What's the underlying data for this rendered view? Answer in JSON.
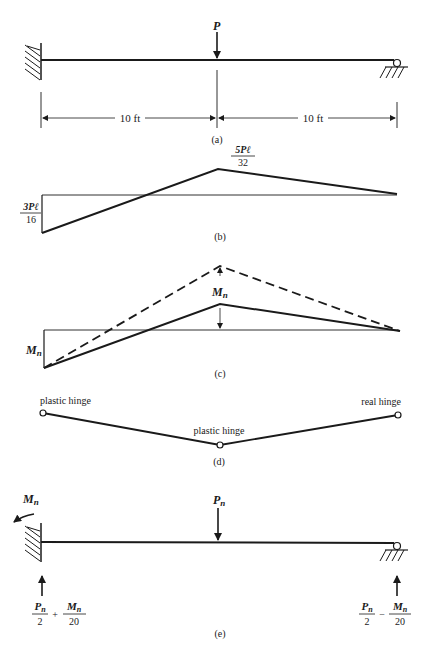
{
  "figure": {
    "part_a": {
      "caption": "(a)",
      "load_label": "P",
      "span_left": "10 ft",
      "span_right": "10 ft",
      "left_support": "fixed",
      "right_support": "roller"
    },
    "part_b": {
      "caption": "(b)",
      "positive_moment": {
        "num": "5Pℓ",
        "den": "32"
      },
      "negative_moment": {
        "num": "3Pℓ",
        "den": "16"
      }
    },
    "part_c": {
      "caption": "(c)",
      "left_moment": "M",
      "left_moment_sub": "n",
      "mid_moment": "M",
      "mid_moment_sub": "n"
    },
    "part_d": {
      "caption": "(d)",
      "left_hinge": "plastic hinge",
      "mid_hinge": "plastic hinge",
      "right_hinge": "real hinge"
    },
    "part_e": {
      "caption": "(e)",
      "moment_label": "M",
      "moment_sub": "n",
      "load_label": "P",
      "load_sub": "n",
      "left_reaction": {
        "a_num": "P",
        "a_sub": "n",
        "a_den": "2",
        "op": "+",
        "b_num": "M",
        "b_sub": "n",
        "b_den": "20"
      },
      "right_reaction": {
        "a_num": "P",
        "a_sub": "n",
        "a_den": "2",
        "op": "−",
        "b_num": "M",
        "b_sub": "n",
        "b_den": "20"
      }
    }
  }
}
